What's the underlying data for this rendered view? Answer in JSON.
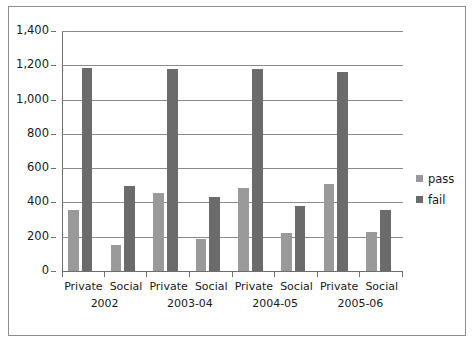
{
  "chart_data": {
    "type": "bar",
    "title": "",
    "subtitle": "",
    "xlabel": "",
    "ylabel": "",
    "ylim": [
      0,
      1400
    ],
    "ytick_step": 200,
    "yticks": [
      "1,400",
      "1,200",
      "1,000",
      "800",
      "600",
      "400",
      "200",
      "0"
    ],
    "ytick_values": [
      1400,
      1200,
      1000,
      800,
      600,
      400,
      200,
      0
    ],
    "grid": true,
    "legend_position": "right",
    "categories": [
      "Private",
      "Social",
      "Private",
      "Social",
      "Private",
      "Social",
      "Private",
      "Social"
    ],
    "group_labels": [
      "2002",
      "2003-04",
      "2004-05",
      "2005-06"
    ],
    "group_span": 2,
    "series": [
      {
        "name": "pass",
        "color": "#9a9a9a",
        "values": [
          355,
          150,
          455,
          185,
          485,
          220,
          510,
          225
        ]
      },
      {
        "name": "fail",
        "color": "#6b6b6b",
        "values": [
          1183,
          495,
          1180,
          430,
          1180,
          378,
          1160,
          358
        ]
      }
    ]
  },
  "legend": {
    "items": [
      {
        "label": "pass",
        "color": "#9a9a9a"
      },
      {
        "label": "fail",
        "color": "#6b6b6b"
      }
    ]
  },
  "colors": {
    "pass": "#9a9a9a",
    "fail": "#6b6b6b",
    "grid": "#8a8a8a",
    "axis": "#6e6e6e",
    "frame": "#8d8d8d",
    "text": "#1a1a1a",
    "background": "#ffffff"
  }
}
